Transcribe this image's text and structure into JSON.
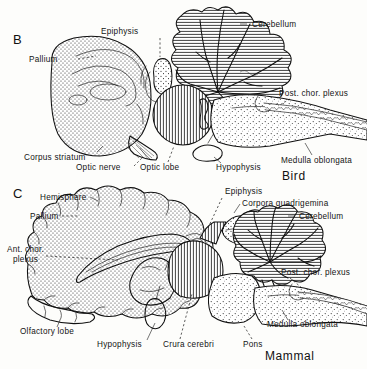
{
  "figure": {
    "background_color": "#fdfdfb",
    "ink_color": "#141414"
  },
  "panels": [
    {
      "letter": "B",
      "taxon": "Bird",
      "labels": [
        {
          "id": "pallium",
          "text": "Pallium"
        },
        {
          "id": "epiphysis",
          "text": "Epiphysis"
        },
        {
          "id": "cerebellum",
          "text": "Cerebellum"
        },
        {
          "id": "post-chor-plexus",
          "text": "Post. chor. plexus"
        },
        {
          "id": "medulla",
          "text": "Medulla oblongata"
        },
        {
          "id": "hypophysis",
          "text": "Hypophysis"
        },
        {
          "id": "optic-lobe",
          "text": "Optic lobe"
        },
        {
          "id": "optic-nerve",
          "text": "Optic nerve"
        },
        {
          "id": "corpus-striatum",
          "text": "Corpus striatum"
        }
      ]
    },
    {
      "letter": "C",
      "taxon": "Mammal",
      "labels": [
        {
          "id": "hemisphere",
          "text": "Hemisphere"
        },
        {
          "id": "pallium",
          "text": "Pallium"
        },
        {
          "id": "ant-chor-plexus-1",
          "text": "Ant. chor."
        },
        {
          "id": "ant-chor-plexus-2",
          "text": "plexus"
        },
        {
          "id": "epiphysis",
          "text": "Epiphysis"
        },
        {
          "id": "corpora-quad",
          "text": "Corpora quadrigemina"
        },
        {
          "id": "cerebellum",
          "text": "Cerebellum"
        },
        {
          "id": "post-chor-plexus",
          "text": "Post. chor. plexus"
        },
        {
          "id": "medulla",
          "text": "Medulla oblongata"
        },
        {
          "id": "pons",
          "text": "Pons"
        },
        {
          "id": "crura-cerebri",
          "text": "Crura cerebri"
        },
        {
          "id": "hypophysis",
          "text": "Hypophysis"
        },
        {
          "id": "olfactory-lobe",
          "text": "Olfactory lobe"
        }
      ]
    }
  ]
}
